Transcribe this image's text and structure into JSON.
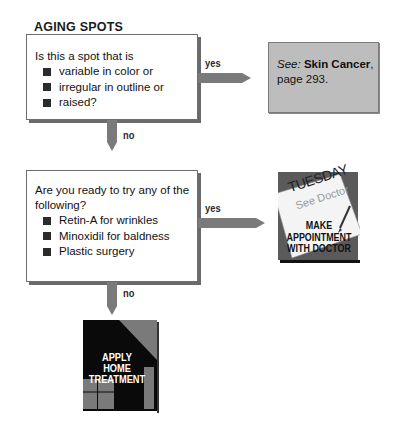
{
  "title": "AGING SPOTS",
  "decision1": {
    "question": "Is this a spot that is",
    "bullets": [
      "variable in color or",
      "irregular in outline or",
      "raised?"
    ],
    "yes_label": "yes",
    "no_label": "no"
  },
  "reference": {
    "see_label": "See:",
    "topic": "Skin Cancer",
    "page_text": "page 293."
  },
  "decision2": {
    "question": "Are you ready to try any of the following?",
    "bullets": [
      "Retin-A for wrinkles",
      "Minoxidil for baldness",
      "Plastic surgery"
    ],
    "yes_label": "yes",
    "no_label": "no"
  },
  "outcome_doctor": {
    "calendar_day": "TUESDAY",
    "calendar_note": "See Doctor",
    "line1": "MAKE",
    "line2": "APPOINTMENT",
    "line3": "WITH DOCTOR",
    "icon": "calendar-appointment-icon"
  },
  "outcome_home": {
    "line1": "APPLY",
    "line2": "HOME",
    "line3": "TREATMENT",
    "icon": "house-icon"
  },
  "colors": {
    "arrow": "#7a7a7a",
    "reference_bg": "#bdbdbd",
    "house_bg": "#0a0a0a",
    "doctor_bg": "#555555"
  }
}
